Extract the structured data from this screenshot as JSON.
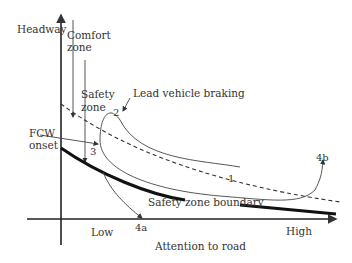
{
  "axes": {
    "y_label": "Headway",
    "x_label": "Attention to road",
    "x_low": "Low",
    "x_high": "High"
  },
  "zones": {
    "comfort_line1": "Comfort",
    "comfort_line2": "zone",
    "safety_line1": "Safety",
    "safety_line2": "zone"
  },
  "annotations": {
    "lead_vehicle": "Lead vehicle braking",
    "fcw_line1": "FCW",
    "fcw_line2": "onset",
    "boundary": "Safety zone boundary"
  },
  "points": {
    "p1": "1",
    "p2": "2",
    "p3": "3",
    "p4a": "4a",
    "p4b": "4b"
  },
  "colors": {
    "line": "#333333",
    "boundary": "#111111"
  }
}
